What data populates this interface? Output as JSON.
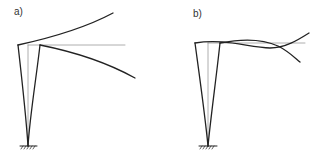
{
  "panels": [
    {
      "label": "a)",
      "description": "Cantilever column with deflected shapes diverging (symmetric/antisymmetric sway)"
    },
    {
      "label": "b)",
      "description": "Cantilever column with deflected shapes crossing the reference line"
    }
  ],
  "colors": {
    "deflected": "#222222",
    "reference": "#9a9a9a",
    "support": "#222222"
  }
}
